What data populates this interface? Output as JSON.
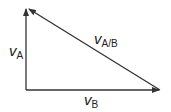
{
  "diagram": {
    "type": "vector-triangle",
    "stroke_color": "#333333",
    "vectors": [
      {
        "id": "vA",
        "symbol": "v",
        "subscript": "A",
        "from": [
          26,
          90
        ],
        "to": [
          26,
          8
        ]
      },
      {
        "id": "vB",
        "symbol": "v",
        "subscript": "B",
        "from": [
          26,
          90
        ],
        "to": [
          160,
          90
        ]
      },
      {
        "id": "vAB",
        "symbol": "v",
        "subscript": "A/B",
        "from": [
          160,
          90
        ],
        "to": [
          28,
          8
        ]
      }
    ]
  }
}
